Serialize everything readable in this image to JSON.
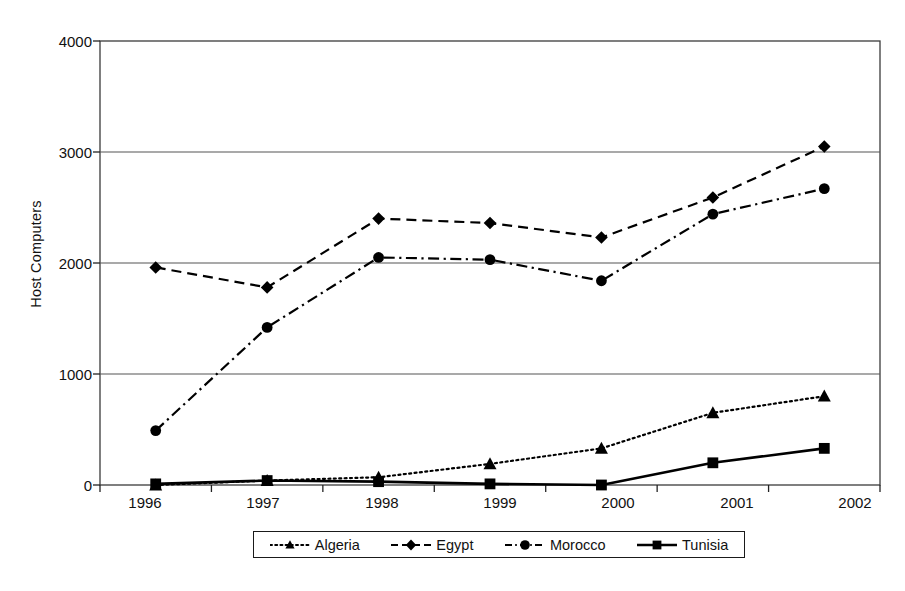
{
  "chart_data": {
    "type": "line",
    "title": "",
    "xlabel": "",
    "ylabel": "Host Computers",
    "categories": [
      "1996",
      "1997",
      "1998",
      "1999",
      "2000",
      "2001",
      "2002"
    ],
    "ylim": [
      0,
      4000
    ],
    "yticks": [
      0,
      1000,
      2000,
      3000,
      4000
    ],
    "grid": true,
    "legend_position": "bottom",
    "series": [
      {
        "name": "Algeria",
        "marker": "triangle",
        "line_style": "dotted",
        "color": "#000000",
        "values": [
          0,
          40,
          70,
          190,
          330,
          650,
          800
        ]
      },
      {
        "name": "Egypt",
        "marker": "diamond",
        "line_style": "dashed",
        "color": "#000000",
        "values": [
          1960,
          1780,
          2400,
          2360,
          2230,
          2590,
          3050
        ]
      },
      {
        "name": "Morocco",
        "marker": "circle",
        "line_style": "dashdot",
        "color": "#000000",
        "values": [
          490,
          1420,
          2050,
          2030,
          1840,
          2440,
          2670
        ]
      },
      {
        "name": "Tunisia",
        "marker": "square",
        "line_style": "solid",
        "color": "#000000",
        "values": [
          10,
          40,
          30,
          10,
          0,
          200,
          330
        ]
      }
    ]
  },
  "ytick_labels": [
    "4000",
    "3000",
    "2000",
    "1000",
    "0"
  ],
  "legend": {
    "items": [
      {
        "label": "Algeria"
      },
      {
        "label": "Egypt"
      },
      {
        "label": "Morocco"
      },
      {
        "label": "Tunisia"
      }
    ]
  }
}
